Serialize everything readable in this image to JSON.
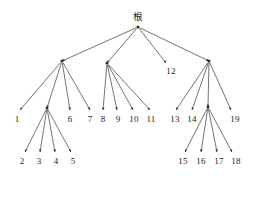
{
  "figure": {
    "type": "tree-diagram",
    "background_color": "#ffffff",
    "stroke_color": "#2a2a2a",
    "text_color": "#1a1a1a",
    "width": 254,
    "height": 199
  },
  "nodes": [
    {
      "id": "root",
      "label": "根",
      "label_x": 138,
      "label_y": 17,
      "point_x": 138,
      "point_y": 27,
      "kind": "root",
      "has_dot": true
    },
    {
      "id": "a",
      "label": "",
      "label_x": 62,
      "label_y": 61,
      "point_x": 62,
      "point_y": 61,
      "kind": "internal",
      "has_dot": true
    },
    {
      "id": "b",
      "label": "",
      "label_x": 107,
      "label_y": 63,
      "point_x": 107,
      "point_y": 63,
      "kind": "internal",
      "has_dot": true
    },
    {
      "id": "n12",
      "label": "12",
      "label_x": 171,
      "label_y": 71,
      "point_x": 166,
      "point_y": 63,
      "kind": "leaf",
      "has_dot": false
    },
    {
      "id": "c",
      "label": "",
      "label_x": 209,
      "label_y": 61,
      "point_x": 209,
      "point_y": 61,
      "kind": "internal",
      "has_dot": true
    },
    {
      "id": "n1",
      "label": "1",
      "label_x": 17,
      "label_y": 119,
      "point_x": 20,
      "point_y": 110,
      "kind": "leaf",
      "has_dot": false
    },
    {
      "id": "d",
      "label": "",
      "label_x": 47,
      "label_y": 108,
      "point_x": 47,
      "point_y": 108,
      "kind": "internal",
      "has_dot": true
    },
    {
      "id": "n6",
      "label": "6",
      "label_x": 70,
      "label_y": 119,
      "point_x": 70,
      "point_y": 110,
      "kind": "leaf",
      "has_dot": false
    },
    {
      "id": "n7",
      "label": "7",
      "label_x": 90,
      "label_y": 119,
      "point_x": 90,
      "point_y": 110,
      "kind": "leaf",
      "has_dot": false
    },
    {
      "id": "n2",
      "label": "2",
      "label_x": 22,
      "label_y": 161,
      "point_x": 25,
      "point_y": 152,
      "kind": "leaf",
      "has_dot": false
    },
    {
      "id": "n3",
      "label": "3",
      "label_x": 39,
      "label_y": 161,
      "point_x": 40,
      "point_y": 152,
      "kind": "leaf",
      "has_dot": false
    },
    {
      "id": "n4",
      "label": "4",
      "label_x": 56,
      "label_y": 161,
      "point_x": 55,
      "point_y": 152,
      "kind": "leaf",
      "has_dot": false
    },
    {
      "id": "n5",
      "label": "5",
      "label_x": 73,
      "label_y": 161,
      "point_x": 71,
      "point_y": 152,
      "kind": "leaf",
      "has_dot": false
    },
    {
      "id": "n8",
      "label": "8",
      "label_x": 103,
      "label_y": 119,
      "point_x": 103,
      "point_y": 110,
      "kind": "leaf",
      "has_dot": false
    },
    {
      "id": "n9",
      "label": "9",
      "label_x": 118,
      "label_y": 119,
      "point_x": 117,
      "point_y": 110,
      "kind": "leaf",
      "has_dot": false
    },
    {
      "id": "n10",
      "label": "10",
      "label_x": 134,
      "label_y": 119,
      "point_x": 133,
      "point_y": 110,
      "kind": "leaf",
      "has_dot": false
    },
    {
      "id": "n11",
      "label": "11",
      "label_x": 151,
      "label_y": 119,
      "point_x": 150,
      "point_y": 110,
      "kind": "leaf",
      "has_dot": false
    },
    {
      "id": "n13",
      "label": "13",
      "label_x": 175,
      "label_y": 119,
      "point_x": 176,
      "point_y": 110,
      "kind": "leaf",
      "has_dot": false
    },
    {
      "id": "n14",
      "label": "14",
      "label_x": 192,
      "label_y": 119,
      "point_x": 192,
      "point_y": 110,
      "kind": "leaf",
      "has_dot": false
    },
    {
      "id": "e",
      "label": "",
      "label_x": 208,
      "label_y": 107,
      "point_x": 208,
      "point_y": 107,
      "kind": "internal",
      "has_dot": true
    },
    {
      "id": "n19",
      "label": "19",
      "label_x": 235,
      "label_y": 119,
      "point_x": 231,
      "point_y": 110,
      "kind": "leaf",
      "has_dot": false
    },
    {
      "id": "n15",
      "label": "15",
      "label_x": 183,
      "label_y": 161,
      "point_x": 185,
      "point_y": 152,
      "kind": "leaf",
      "has_dot": false
    },
    {
      "id": "n16",
      "label": "16",
      "label_x": 201,
      "label_y": 161,
      "point_x": 201,
      "point_y": 152,
      "kind": "leaf",
      "has_dot": false
    },
    {
      "id": "n17",
      "label": "17",
      "label_x": 219,
      "label_y": 161,
      "point_x": 217,
      "point_y": 152,
      "kind": "leaf",
      "has_dot": false
    },
    {
      "id": "n18",
      "label": "18",
      "label_x": 236,
      "label_y": 161,
      "point_x": 232,
      "point_y": 152,
      "kind": "leaf",
      "has_dot": false
    }
  ],
  "edges": [
    {
      "from": "root",
      "to": "a"
    },
    {
      "from": "root",
      "to": "b"
    },
    {
      "from": "root",
      "to": "n12"
    },
    {
      "from": "root",
      "to": "c"
    },
    {
      "from": "a",
      "to": "n1"
    },
    {
      "from": "a",
      "to": "d"
    },
    {
      "from": "a",
      "to": "n6"
    },
    {
      "from": "a",
      "to": "n7"
    },
    {
      "from": "d",
      "to": "n2"
    },
    {
      "from": "d",
      "to": "n3"
    },
    {
      "from": "d",
      "to": "n4"
    },
    {
      "from": "d",
      "to": "n5"
    },
    {
      "from": "b",
      "to": "n8"
    },
    {
      "from": "b",
      "to": "n9"
    },
    {
      "from": "b",
      "to": "n10"
    },
    {
      "from": "b",
      "to": "n11"
    },
    {
      "from": "c",
      "to": "n13"
    },
    {
      "from": "c",
      "to": "n14"
    },
    {
      "from": "c",
      "to": "e"
    },
    {
      "from": "c",
      "to": "n19"
    },
    {
      "from": "e",
      "to": "n15"
    },
    {
      "from": "e",
      "to": "n16"
    },
    {
      "from": "e",
      "to": "n17"
    },
    {
      "from": "e",
      "to": "n18"
    }
  ]
}
